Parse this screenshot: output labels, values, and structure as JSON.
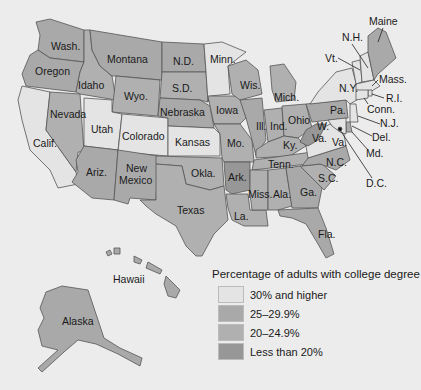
{
  "title": "Percentage of adults with college degree",
  "colors": {
    "background": "#ececec",
    "cat_30_plus": "#e4e4e4",
    "cat_25_29": "#a9a9a9",
    "cat_20_24": "#b0b0b0",
    "cat_lt_20": "#979797"
  },
  "legend": {
    "title": "Percentage of adults with college degree",
    "items": [
      {
        "label": "30% and higher",
        "key": "cat_30_plus",
        "color": "#e4e4e4"
      },
      {
        "label": "25–29.9%",
        "key": "cat_25_29",
        "color": "#a9a9a9"
      },
      {
        "label": "20–24.9%",
        "key": "cat_20_24",
        "color": "#b0b0b0"
      },
      {
        "label": "Less than 20%",
        "key": "cat_lt_20",
        "color": "#979797"
      }
    ]
  },
  "states": {
    "wash": {
      "label": "Wash.",
      "category": "25–29.9%"
    },
    "oregon": {
      "label": "Oregon",
      "category": "25–29.9%"
    },
    "calif": {
      "label": "Calif.",
      "category": "30% and higher"
    },
    "idaho": {
      "label": "Idaho",
      "category": "20–24.9%"
    },
    "nevada": {
      "label": "Nevada",
      "category": "20–24.9%"
    },
    "montana": {
      "label": "Montana",
      "category": "25–29.9%"
    },
    "wyo": {
      "label": "Wyo.",
      "category": "20–24.9%"
    },
    "utah": {
      "label": "Utah",
      "category": "30% and higher"
    },
    "colorado": {
      "label": "Colorado",
      "category": "30% and higher"
    },
    "ariz": {
      "label": "Ariz.",
      "category": "25–29.9%"
    },
    "new_mexico": {
      "label": "New\nMexico",
      "label_line1": "New",
      "label_line2": "Mexico",
      "category": "25–29.9%"
    },
    "nd": {
      "label": "N.D.",
      "category": "25–29.9%"
    },
    "sd": {
      "label": "S.D.",
      "category": "20–24.9%"
    },
    "nebraska": {
      "label": "Nebraska",
      "category": "25–29.9%"
    },
    "kansas": {
      "label": "Kansas",
      "category": "30% and higher"
    },
    "okla": {
      "label": "Okla.",
      "category": "20–24.9%"
    },
    "texas": {
      "label": "Texas",
      "category": "20–24.9%"
    },
    "minn": {
      "label": "Minn.",
      "category": "30% and higher"
    },
    "iowa": {
      "label": "Iowa",
      "category": "20–24.9%"
    },
    "mo": {
      "label": "Mo.",
      "category": "20–24.9%"
    },
    "ark": {
      "label": "Ark.",
      "category": "Less than 20%"
    },
    "la": {
      "label": "La.",
      "category": "20–24.9%"
    },
    "wis": {
      "label": "Wis.",
      "category": "20–24.9%"
    },
    "ill": {
      "label": "Ill.",
      "category": "25–29.9%"
    },
    "mich": {
      "label": "Mich.",
      "category": "20–24.9%"
    },
    "ind": {
      "label": "Ind.",
      "category": "20–24.9%"
    },
    "ohio": {
      "label": "Ohio",
      "category": "20–24.9%"
    },
    "ky": {
      "label": "Ky.",
      "category": "20–24.9%"
    },
    "tenn": {
      "label": "Tenn.",
      "category": "20–24.9%"
    },
    "miss": {
      "label": "Miss.",
      "category": "20–24.9%"
    },
    "ala": {
      "label": "Ala.",
      "category": "20–24.9%"
    },
    "ga": {
      "label": "Ga.",
      "category": "25–29.9%"
    },
    "fla": {
      "label": "Fla.",
      "category": "25–29.9%"
    },
    "sc": {
      "label": "S.C.",
      "category": "20–24.9%"
    },
    "nc": {
      "label": "N.C.",
      "category": "25–29.9%"
    },
    "va": {
      "label": "Va.",
      "category": "30% and higher"
    },
    "wva": {
      "label_line1": "W.",
      "label_line2": "Va.",
      "category": "Less than 20%"
    },
    "pa": {
      "label": "Pa.",
      "category": "25–29.9%"
    },
    "ny": {
      "label": "N.Y.",
      "category": "30% and higher"
    },
    "vt": {
      "label": "Vt.",
      "category": "30% and higher"
    },
    "nh": {
      "label": "N.H.",
      "category": "30% and higher"
    },
    "maine": {
      "label": "Maine",
      "category": "25–29.9%"
    },
    "mass": {
      "label": "Mass.",
      "category": "30% and higher"
    },
    "ri": {
      "label": "R.I.",
      "category": "30% and higher"
    },
    "conn": {
      "label": "Conn.",
      "category": "30% and higher"
    },
    "nj": {
      "label": "N.J.",
      "category": "30% and higher"
    },
    "del": {
      "label": "Del.",
      "category": "25–29.9%"
    },
    "md": {
      "label": "Md.",
      "category": "30% and higher"
    },
    "dc": {
      "label": "D.C.",
      "category": "30% and higher"
    },
    "alaska": {
      "label": "Alaska",
      "category": "25–29.9%"
    },
    "hawaii": {
      "label": "Hawaii",
      "category": "25–29.9%"
    }
  }
}
